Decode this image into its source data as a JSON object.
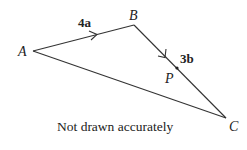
{
  "diagram": {
    "type": "vector-triangle",
    "points": {
      "A": {
        "label": "A",
        "x": 33,
        "y": 51
      },
      "B": {
        "label": "B",
        "x": 134,
        "y": 25
      },
      "C": {
        "label": "C",
        "x": 226,
        "y": 118
      },
      "P": {
        "label": "P",
        "x": 177,
        "y": 68
      }
    },
    "edges": [
      {
        "from": "A",
        "to": "B",
        "vector_label": "4a",
        "arrow": true
      },
      {
        "from": "B",
        "to": "C",
        "vector_label": "3b",
        "arrow": true
      },
      {
        "from": "A",
        "to": "C",
        "vector_label": "",
        "arrow": false
      }
    ],
    "vector_labels": {
      "AB": "4a",
      "BC": "3b"
    },
    "note": "Not drawn accurately",
    "colors": {
      "line": "#333333",
      "text": "#222222",
      "background": "#ffffff"
    }
  }
}
